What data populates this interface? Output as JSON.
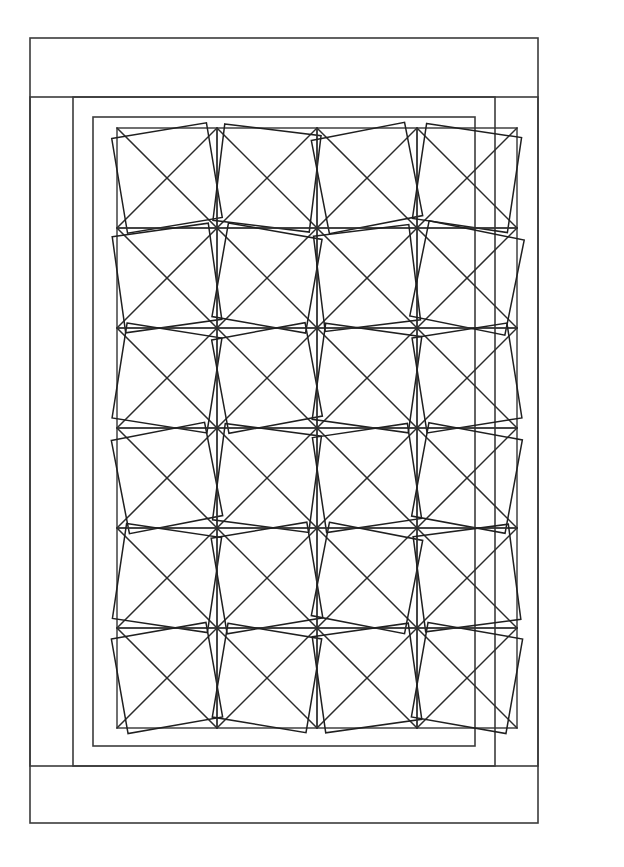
{
  "document": {
    "title": "Quilt Block Line Diagram",
    "background_color": "#ffffff",
    "width": 624,
    "height": 867
  },
  "style": {
    "line_color": "#333333",
    "frame_color": "#3b3b3b",
    "inner_square_color": "#1f1f1f",
    "fill": "none",
    "line_width": 1.5
  },
  "frames": [
    {
      "name": "outer-border",
      "label": "Outer border",
      "x": 30,
      "y": 38,
      "width": 508,
      "height": 785
    },
    {
      "name": "second-border",
      "label": "Second border",
      "x": 30,
      "y": 97,
      "width": 508,
      "height": 669
    },
    {
      "name": "third-border",
      "label": "Third border",
      "x": 73,
      "y": 97,
      "width": 422,
      "height": 669
    },
    {
      "name": "inner-border",
      "label": "Inner border",
      "x": 93,
      "y": 117,
      "width": 382,
      "height": 629
    }
  ],
  "grid": {
    "name": "block-grid",
    "origin_x": 117,
    "origin_y": 128,
    "columns": 4,
    "rows": 6,
    "cell_size": 100,
    "total_blocks": 24,
    "block_pattern": "square-on-square with crossed diagonals"
  },
  "chart_data": {
    "type": "diagram",
    "grid_columns": 4,
    "grid_rows": 6,
    "cell_size_px": 100,
    "blocks": [
      {
        "row": 0,
        "col": 0,
        "rotation_deg": -9.5,
        "scale": 0.96
      },
      {
        "row": 0,
        "col": 1,
        "rotation_deg": 7.0,
        "scale": 0.97
      },
      {
        "row": 0,
        "col": 2,
        "rotation_deg": -11.0,
        "scale": 0.95
      },
      {
        "row": 0,
        "col": 3,
        "rotation_deg": 8.5,
        "scale": 0.96
      },
      {
        "row": 1,
        "col": 0,
        "rotation_deg": -8.0,
        "scale": 0.97
      },
      {
        "row": 1,
        "col": 1,
        "rotation_deg": 10.0,
        "scale": 0.95
      },
      {
        "row": 1,
        "col": 2,
        "rotation_deg": -7.0,
        "scale": 0.96
      },
      {
        "row": 1,
        "col": 3,
        "rotation_deg": 11.5,
        "scale": 0.97
      },
      {
        "row": 2,
        "col": 0,
        "rotation_deg": 9.0,
        "scale": 0.96
      },
      {
        "row": 2,
        "col": 1,
        "rotation_deg": -10.5,
        "scale": 0.95
      },
      {
        "row": 2,
        "col": 2,
        "rotation_deg": 8.0,
        "scale": 0.97
      },
      {
        "row": 2,
        "col": 3,
        "rotation_deg": -9.0,
        "scale": 0.96
      },
      {
        "row": 3,
        "col": 0,
        "rotation_deg": -11.0,
        "scale": 0.95
      },
      {
        "row": 3,
        "col": 1,
        "rotation_deg": 7.5,
        "scale": 0.97
      },
      {
        "row": 3,
        "col": 2,
        "rotation_deg": -8.5,
        "scale": 0.96
      },
      {
        "row": 3,
        "col": 3,
        "rotation_deg": 10.5,
        "scale": 0.95
      },
      {
        "row": 4,
        "col": 0,
        "rotation_deg": 8.5,
        "scale": 0.96
      },
      {
        "row": 4,
        "col": 1,
        "rotation_deg": -9.5,
        "scale": 0.97
      },
      {
        "row": 4,
        "col": 2,
        "rotation_deg": 11.0,
        "scale": 0.95
      },
      {
        "row": 4,
        "col": 3,
        "rotation_deg": -7.5,
        "scale": 0.96
      },
      {
        "row": 5,
        "col": 0,
        "rotation_deg": -10.0,
        "scale": 0.96
      },
      {
        "row": 5,
        "col": 1,
        "rotation_deg": 9.5,
        "scale": 0.95
      },
      {
        "row": 5,
        "col": 2,
        "rotation_deg": -8.0,
        "scale": 0.97
      },
      {
        "row": 5,
        "col": 3,
        "rotation_deg": 10.0,
        "scale": 0.96
      }
    ]
  }
}
